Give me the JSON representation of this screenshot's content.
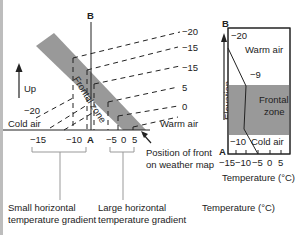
{
  "main_diagram": {
    "top_label": "B",
    "bottom_label": "A",
    "up_label": "Up",
    "frontal_zone_label": "Frontal zone",
    "cold_air_label": "Cold air",
    "warm_air_label": "Warm air",
    "left_isotherm_label": "−20",
    "isotherm_labels_right": [
      "−20",
      "−15",
      "−15",
      "5",
      "0",
      "5"
    ],
    "x_axis_ticks": [
      "−15",
      "−10",
      "A",
      "−5",
      "0",
      "5"
    ],
    "front_position_label_line1": "Position of front",
    "front_position_label_line2": "on weather map",
    "small_gradient_line1": "Small horizontal",
    "small_gradient_line2": "temperature gradient",
    "large_gradient_line1": "Large horizontal",
    "large_gradient_line2": "temperature gradient",
    "colors": {
      "frontal_zone": "#999999",
      "line": "#222222"
    }
  },
  "profile_panel": {
    "top_label": "B",
    "bottom_label": "A",
    "y_axis_label": "Elevation",
    "warm_air_label": "Warm air",
    "frontal_zone_line1": "Frontal",
    "frontal_zone_line2": "zone",
    "cold_air_label": "Cold air",
    "temp_top": "−20",
    "temp_front_top": "−9",
    "temp_front_bottom": "−10",
    "x_axis_ticks": [
      "−15",
      "−10",
      "−5",
      "0",
      "5"
    ],
    "x_axis_label": "Temperature (°C)"
  },
  "footer": {
    "temperature_label": "Temperature (°C)"
  }
}
